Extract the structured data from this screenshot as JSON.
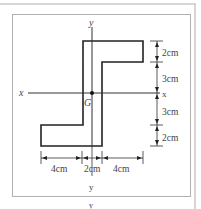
{
  "diagram": {
    "axes": {
      "x_label_left": "x",
      "x_label_right": "x",
      "y_label_top": "y",
      "y_label_bottom": "y",
      "y_label_below_frame": "y"
    },
    "centroid_label": "G",
    "right_dimensions": [
      "2cm",
      "3cm",
      "3cm",
      "2cm"
    ],
    "bottom_dimensions": [
      "4cm",
      "2cm",
      "4cm"
    ],
    "colors": {
      "stroke": "#222222",
      "frame": "#b0b0b0",
      "text": "#444444",
      "background": "#ffffff"
    }
  }
}
